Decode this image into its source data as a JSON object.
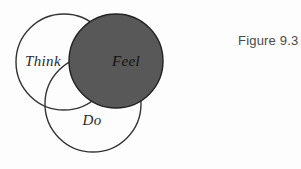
{
  "figure": {
    "caption": "Figure 9.3",
    "background_color": "#fdfdfd",
    "stroke_color": "#333333",
    "filled_color": "#585858"
  },
  "diagram": {
    "type": "venn-three-circle",
    "circles": [
      {
        "id": "think",
        "label": "Think",
        "cx": 64,
        "cy": 62,
        "r": 48,
        "fill": "none",
        "filled": "false",
        "label_x": 43,
        "label_y": 66
      },
      {
        "id": "feel",
        "label": "Feel",
        "cx": 116,
        "cy": 61,
        "r": 47,
        "fill": "#585858",
        "filled": "true",
        "label_x": 126,
        "label_y": 66
      },
      {
        "id": "do",
        "label": "Do",
        "cx": 93,
        "cy": 104,
        "r": 48,
        "fill": "none",
        "filled": "false",
        "label_x": 92,
        "label_y": 125
      }
    ]
  }
}
